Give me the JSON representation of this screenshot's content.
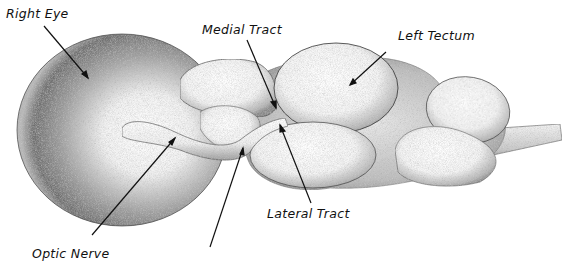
{
  "diagram": {
    "type": "anatomical-illustration",
    "style": "stippled pen-and-ink",
    "colors": {
      "ink": "#111111",
      "background": "#ffffff"
    },
    "labels": [
      {
        "id": "right-eye",
        "text": "Right Eye",
        "x": 6,
        "y": 8,
        "arrow_from": [
          44,
          26
        ],
        "arrow_to": [
          88,
          78
        ]
      },
      {
        "id": "medial-tract",
        "text": "Medial Tract",
        "x": 202,
        "y": 24,
        "arrow_from": [
          247,
          40
        ],
        "arrow_to": [
          276,
          108
        ]
      },
      {
        "id": "left-tectum",
        "text": "Left Tectum",
        "x": 398,
        "y": 30,
        "arrow_from": [
          386,
          52
        ],
        "arrow_to": [
          350,
          85
        ]
      },
      {
        "id": "lateral-tract",
        "text": "Lateral Tract",
        "x": 267,
        "y": 208,
        "arrow_from": [
          311,
          203
        ],
        "arrow_to": [
          280,
          125
        ]
      },
      {
        "id": "optic-nerve",
        "text": "Optic Nerve",
        "x": 32,
        "y": 248,
        "arrow_from": [
          92,
          235
        ],
        "arrow_to": [
          175,
          138
        ]
      },
      {
        "id": "unlabeled-pointer",
        "text": "",
        "arrow_from": [
          210,
          247
        ],
        "arrow_to": [
          243,
          148
        ]
      }
    ]
  }
}
